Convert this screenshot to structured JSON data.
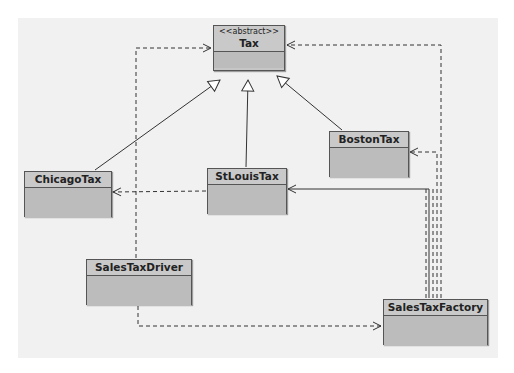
{
  "diagram": {
    "type": "uml-class-diagram",
    "classes": [
      {
        "id": "tax",
        "name": "Tax",
        "stereotype": "<<abstract>>"
      },
      {
        "id": "chicago",
        "name": "ChicagoTax"
      },
      {
        "id": "stlouis",
        "name": "StLouisTax"
      },
      {
        "id": "boston",
        "name": "BostonTax"
      },
      {
        "id": "driver",
        "name": "SalesTaxDriver"
      },
      {
        "id": "factory",
        "name": "SalesTaxFactory"
      }
    ],
    "relationships": [
      {
        "from": "ChicagoTax",
        "to": "Tax",
        "kind": "generalization"
      },
      {
        "from": "StLouisTax",
        "to": "Tax",
        "kind": "generalization"
      },
      {
        "from": "BostonTax",
        "to": "Tax",
        "kind": "generalization"
      },
      {
        "from": "StLouisTax",
        "to": "ChicagoTax",
        "kind": "dependency"
      },
      {
        "from": "SalesTaxDriver",
        "to": "Tax",
        "kind": "dependency"
      },
      {
        "from": "SalesTaxDriver",
        "to": "SalesTaxFactory",
        "kind": "dependency"
      },
      {
        "from": "SalesTaxFactory",
        "to": "Tax",
        "kind": "dependency"
      },
      {
        "from": "SalesTaxFactory",
        "to": "BostonTax",
        "kind": "dependency"
      },
      {
        "from": "SalesTaxFactory",
        "to": "StLouisTax",
        "kind": "association"
      }
    ]
  }
}
